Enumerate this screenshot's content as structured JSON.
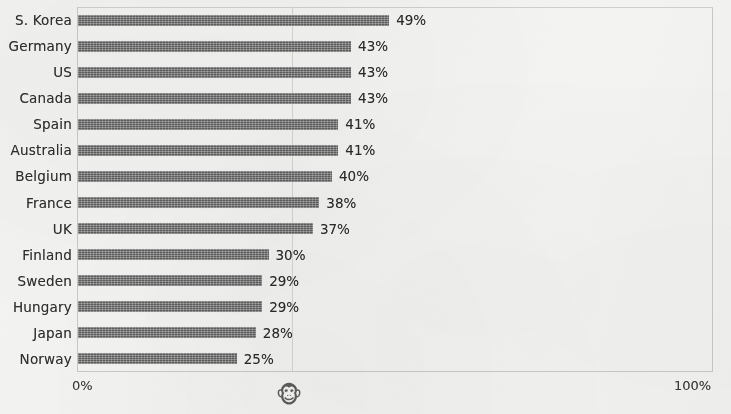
{
  "chart_data": {
    "type": "bar",
    "orientation": "horizontal",
    "title": "",
    "xlabel": "",
    "ylabel": "",
    "xlim": [
      0,
      100
    ],
    "grid": true,
    "legend": null,
    "value_suffix": "%",
    "categories": [
      "S. Korea",
      "Germany",
      "US",
      "Canada",
      "Spain",
      "Australia",
      "Belgium",
      "France",
      "UK",
      "Finland",
      "Sweden",
      "Hungary",
      "Japan",
      "Norway"
    ],
    "values": [
      49,
      43,
      43,
      43,
      41,
      41,
      40,
      38,
      37,
      30,
      29,
      29,
      28,
      25
    ],
    "data_labels": [
      "49%",
      "43%",
      "43%",
      "43%",
      "41%",
      "41%",
      "40%",
      "38%",
      "37%",
      "30%",
      "29%",
      "29%",
      "28%",
      "25%"
    ],
    "axis_ticks": [
      "0%",
      "100%"
    ],
    "bar_color": "#5c5c5c",
    "background_color": "#f3f3f1",
    "gridline_color": "#d5d5d2",
    "axis_color": "#c9c9c6"
  },
  "axis": {
    "min_label": "0%",
    "max_label": "100%"
  },
  "watermark": {
    "icon": "monkey-face-icon",
    "glyph": "🐵"
  }
}
